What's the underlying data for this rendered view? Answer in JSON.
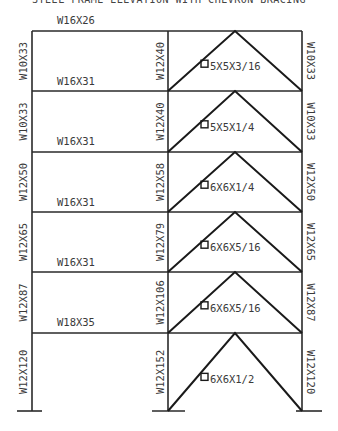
{
  "diagram": {
    "title": "STEEL FRAME ELEVATION WITH CHEVRON BRACING",
    "geometry": {
      "col_x": [
        32,
        168,
        302
      ],
      "floor_y": [
        31,
        91,
        152,
        212,
        272,
        333,
        411
      ],
      "base_plates": [
        [
          17,
          42
        ],
        [
          152,
          185
        ],
        [
          296,
          322
        ]
      ]
    },
    "beams_left_bay": [
      {
        "level": "roof",
        "label": "W16X26",
        "label_x": 57,
        "label_y": 24
      },
      {
        "level": "5",
        "label": "W16X31",
        "label_x": 57,
        "label_y": 85
      },
      {
        "level": "4",
        "label": "W16X31",
        "label_x": 57,
        "label_y": 145
      },
      {
        "level": "3",
        "label": "W16X31",
        "label_x": 57,
        "label_y": 206
      },
      {
        "level": "2",
        "label": "W16X31",
        "label_x": 57,
        "label_y": 266
      },
      {
        "level": "1",
        "label": "W18X35",
        "label_x": 57,
        "label_y": 326
      }
    ],
    "columns": {
      "left": [
        "W10X33",
        "W10X33",
        "W12X50",
        "W12X65",
        "W12X87",
        "W12X120"
      ],
      "middle": [
        "W12X40",
        "W12X40",
        "W12X58",
        "W12X79",
        "W12X106",
        "W12X152"
      ],
      "right": [
        "W10X33",
        "W10X33",
        "W12X50",
        "W12X65",
        "W12X87",
        "W12X120"
      ]
    },
    "braces": [
      "5X5X3/16",
      "5X5X1/4",
      "6X6X1/4",
      "6X6X5/16",
      "6X6X5/16",
      "6X6X1/2"
    ],
    "colors": {
      "line": "#2a2a2a",
      "text": "#3a3a3a",
      "background": "#ffffff"
    }
  }
}
